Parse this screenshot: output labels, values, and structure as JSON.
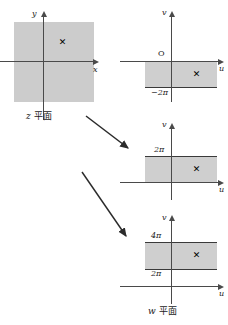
{
  "figure": {
    "colors": {
      "region_fill": "#cfcfcf",
      "region_edge": "#3a3a3a",
      "axis": "#4a4a4a",
      "text": "#1a1a1a",
      "background": "#ffffff"
    }
  },
  "z_panel": {
    "name": "z-plane",
    "plane_label_var": "z",
    "plane_label_cjk": "平面",
    "axis_x_label": "x",
    "axis_y_label": "y",
    "marker": "✕",
    "region": {
      "shape": "square",
      "description": "shaded square centred on origin"
    }
  },
  "w_panels": [
    {
      "name": "w-plane-branch-lower",
      "axis_u_label": "u",
      "axis_v_label": "v",
      "origin_label": "O",
      "marker": "✕",
      "strip_top_label": "",
      "strip_bottom_label": "−2π",
      "strip_range": [
        "-2π",
        "0"
      ]
    },
    {
      "name": "w-plane-branch-principal",
      "axis_u_label": "u",
      "axis_v_label": "v",
      "origin_label": "",
      "marker": "✕",
      "strip_top_label": "2π",
      "strip_bottom_label": "",
      "strip_range": [
        "0",
        "2π"
      ]
    },
    {
      "name": "w-plane-branch-upper",
      "axis_u_label": "u",
      "axis_v_label": "v",
      "origin_label": "",
      "marker": "✕",
      "strip_top_label": "4π",
      "strip_bottom_label": "2π",
      "strip_range": [
        "2π",
        "4π"
      ]
    }
  ],
  "w_plane_caption": {
    "plane_label_var": "w",
    "plane_label_cjk": "平面"
  },
  "mapping_arrows": [
    {
      "name": "arrow-to-principal-strip"
    },
    {
      "name": "arrow-to-upper-strip"
    }
  ]
}
